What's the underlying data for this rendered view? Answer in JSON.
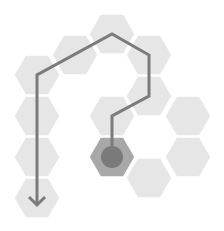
{
  "puzzle": {
    "type": "hex-path",
    "colors": {
      "background": "#ffffff",
      "cell": "#e6e6e6",
      "start_cell": "#a8a8a8",
      "start_dot": "#7a7a7a",
      "path": "#7b7b7b"
    },
    "cells": [
      {
        "id": "a1",
        "cx": 37,
        "cy": 75,
        "state": "visited"
      },
      {
        "id": "a2",
        "cx": 37,
        "cy": 116,
        "state": "visited"
      },
      {
        "id": "a3",
        "cx": 37,
        "cy": 157,
        "state": "visited"
      },
      {
        "id": "a4",
        "cx": 37,
        "cy": 198,
        "state": "end"
      },
      {
        "id": "b1",
        "cx": 75,
        "cy": 55,
        "state": "visited"
      },
      {
        "id": "c1",
        "cx": 112,
        "cy": 34,
        "state": "visited"
      },
      {
        "id": "c2",
        "cx": 112,
        "cy": 116,
        "state": "visited"
      },
      {
        "id": "c3",
        "cx": 112,
        "cy": 157,
        "state": "start"
      },
      {
        "id": "d1",
        "cx": 149,
        "cy": 55,
        "state": "visited"
      },
      {
        "id": "d2",
        "cx": 149,
        "cy": 96,
        "state": "visited"
      },
      {
        "id": "d3",
        "cx": 149,
        "cy": 178,
        "state": "empty"
      },
      {
        "id": "e1",
        "cx": 188,
        "cy": 116,
        "state": "empty"
      },
      {
        "id": "e2",
        "cx": 188,
        "cy": 157,
        "state": "empty"
      }
    ],
    "path": [
      [
        112,
        157
      ],
      [
        112,
        116
      ],
      [
        149,
        96
      ],
      [
        149,
        55
      ],
      [
        112,
        34
      ],
      [
        37,
        75
      ],
      [
        37,
        205
      ]
    ],
    "start_icon": "start-dot-icon",
    "end_icon": "arrow-down-icon"
  }
}
